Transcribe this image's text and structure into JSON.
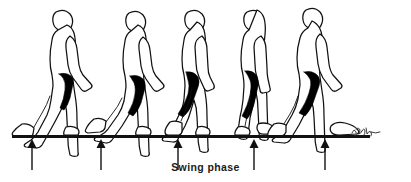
{
  "illustration": {
    "title": "Swing phase",
    "subject": "human gait cycle side-profile sequence",
    "caption": "Swing phase",
    "figure_count": 5,
    "arrow_count": 5,
    "signature": "artist signature",
    "colors": {
      "ink": "#111111",
      "fill": "#ffffff",
      "shadow": "#000000",
      "background": "#ffffff",
      "caption_text": "#1a1a1a"
    },
    "ground_line": {
      "label": "ground-line",
      "x_start": 12,
      "x_end": 370,
      "y": 136,
      "thickness": 3
    },
    "figures": [
      {
        "id": 1,
        "label": "gait-figure-1",
        "phase": "initial contact / heel strike",
        "x": 32
      },
      {
        "id": 2,
        "label": "gait-figure-2",
        "phase": "loading response",
        "x": 101
      },
      {
        "id": 3,
        "label": "gait-figure-3",
        "phase": "mid swing",
        "x": 178
      },
      {
        "id": 4,
        "label": "gait-figure-4",
        "phase": "terminal swing",
        "x": 254
      },
      {
        "id": 5,
        "label": "gait-figure-5",
        "phase": "terminal stance / toe off",
        "x": 325
      }
    ],
    "arrows": [
      {
        "id": 1,
        "label": "ground-reaction-arrow-1",
        "x": 32,
        "y_tip": 140,
        "y_tail": 170
      },
      {
        "id": 2,
        "label": "ground-reaction-arrow-2",
        "x": 101,
        "y_tip": 140,
        "y_tail": 170
      },
      {
        "id": 3,
        "label": "ground-reaction-arrow-3",
        "x": 178,
        "y_tip": 140,
        "y_tail": 170
      },
      {
        "id": 4,
        "label": "ground-reaction-arrow-4",
        "x": 254,
        "y_tip": 140,
        "y_tail": 170
      },
      {
        "id": 5,
        "label": "ground-reaction-arrow-5",
        "x": 325,
        "y_tip": 140,
        "y_tail": 170
      }
    ]
  }
}
